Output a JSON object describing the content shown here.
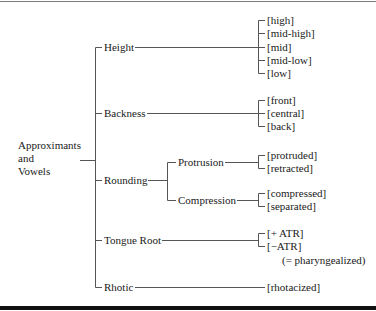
{
  "diagram": {
    "root": {
      "lines": [
        "Approximants",
        "and",
        "Vowels"
      ]
    },
    "features": [
      {
        "label": "Height",
        "values": [
          "[high]",
          "[mid-high]",
          "[mid]",
          "[mid-low]",
          "[low]"
        ]
      },
      {
        "label": "Backness",
        "values": [
          "[front]",
          "[central]",
          "[back]"
        ]
      },
      {
        "label": "Rounding",
        "subfeatures": [
          {
            "label": "Protrusion",
            "values": [
              "[protruded]",
              "[retracted]"
            ]
          },
          {
            "label": "Compression",
            "values": [
              "[compressed]",
              "[separated]"
            ]
          }
        ]
      },
      {
        "label": "Tongue Root",
        "values": [
          "[+ ATR]",
          "[−ATR]"
        ],
        "note": "(= pharyngealized)"
      },
      {
        "label": "Rhotic",
        "values": [
          "[rhotacized]"
        ]
      }
    ]
  },
  "colors": {
    "line": "#555555",
    "text": "#1a1a1a",
    "bottom_rule": "#111111"
  }
}
